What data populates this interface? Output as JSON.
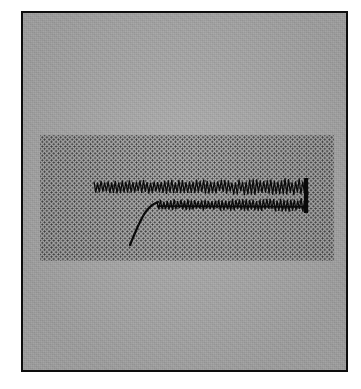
{
  "figure": {
    "kind": "scanned-oscillogram",
    "caption": "",
    "background_color": "#adadad",
    "frame_color": "#0d0d0d",
    "trace_color": "#0a0a0a",
    "stipple_color": "#2b2b2b",
    "page_color": "#ffffff"
  },
  "frame": {
    "left": 21,
    "top": 11,
    "width": 327,
    "height": 361,
    "border_width": 2
  },
  "stipple_region": {
    "name": "shaded-interval",
    "left": 38,
    "top": 133,
    "right": 332,
    "bottom": 259,
    "dot_pitch": 4.6,
    "dot_radius": 0.85
  },
  "chart_data": {
    "type": "line",
    "title": "",
    "subtitle": "",
    "xlabel": "",
    "ylabel": "",
    "xlim": [
      0,
      323
    ],
    "ylim": [
      0,
      357
    ],
    "grid": false,
    "legend": "none",
    "annotations": [
      {
        "name": "shaded-band",
        "type": "rect",
        "x0": 38,
        "x1": 332,
        "y0": 133,
        "y1": 259,
        "style": "stippled-halftone"
      },
      {
        "name": "termination-bar",
        "type": "vline",
        "x": 304,
        "y0": 176,
        "y1": 211
      }
    ],
    "series": [
      {
        "name": "upper-oscillation",
        "kind": "oscillation",
        "x_start": 92,
        "x_end": 306,
        "center_y": 185,
        "amplitude_start": 6.5,
        "amplitude_end": 8.5,
        "period": 3.55,
        "spike_shape": "sawtooth-spike",
        "values": [
          185,
          185,
          185,
          185,
          185,
          185,
          185,
          185,
          185,
          185
        ]
      },
      {
        "name": "lower-oscillation",
        "kind": "oscillation",
        "x_start": 155,
        "x_end": 306,
        "center_y": 203,
        "amplitude_start": 5.0,
        "amplitude_end": 7.0,
        "period": 3.45,
        "spike_shape": "sawtooth-spike",
        "values": [
          203,
          203,
          203,
          203,
          203,
          203,
          203,
          203,
          203,
          203
        ]
      },
      {
        "name": "onset-curve",
        "kind": "smooth",
        "points": [
          [
            128,
            243
          ],
          [
            130,
            238
          ],
          [
            133,
            231
          ],
          [
            136,
            224
          ],
          [
            139,
            218
          ],
          [
            142,
            212
          ],
          [
            146,
            207
          ],
          [
            150,
            203
          ],
          [
            154,
            201
          ],
          [
            156,
            200
          ]
        ]
      }
    ]
  }
}
